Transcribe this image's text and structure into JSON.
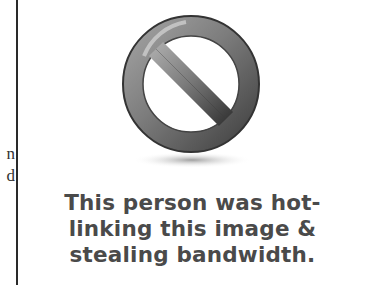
{
  "left_fragment": {
    "lines": [
      "n",
      "d"
    ]
  },
  "icon": {
    "name": "prohibited-icon",
    "ring_color": "#7a7a7a",
    "ring_dark": "#3c3c3c"
  },
  "caption": {
    "lines": [
      "This person was hot-",
      "linking this image &",
      "stealing bandwidth."
    ]
  }
}
